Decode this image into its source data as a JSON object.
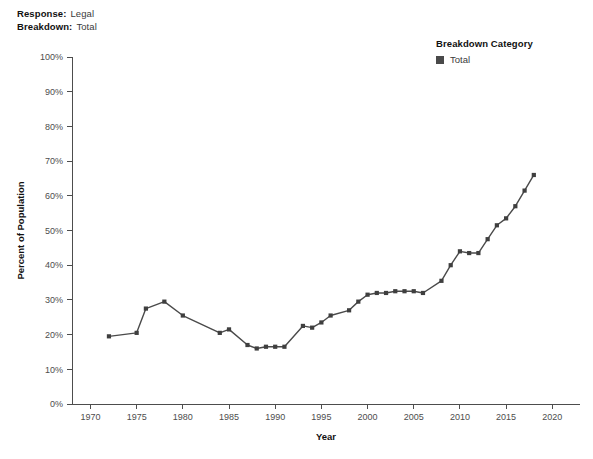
{
  "header": {
    "response_key": "Response:",
    "response_value": "Legal",
    "breakdown_key": "Breakdown:",
    "breakdown_value": "Total"
  },
  "legend": {
    "title": "Breakdown Category",
    "entries": [
      {
        "label": "Total",
        "color": "#4a4a4a"
      }
    ]
  },
  "colors": {
    "series": "#4a4a4a",
    "axis": "#4d4d4d",
    "text": "#1a1a1a",
    "background": "#ffffff"
  },
  "chart_data": {
    "type": "line",
    "title": "",
    "xlabel": "Year",
    "ylabel": "Percent of Population",
    "xlim": [
      1968,
      2023
    ],
    "ylim": [
      0,
      100
    ],
    "xticks": [
      1970,
      1975,
      1980,
      1985,
      1990,
      1995,
      2000,
      2005,
      2010,
      2015,
      2020
    ],
    "xtick_labels": [
      "1970",
      "1975",
      "1980",
      "1985",
      "1990",
      "1995",
      "2000",
      "2005",
      "2010",
      "2015",
      "2020"
    ],
    "yticks": [
      0,
      10,
      20,
      30,
      40,
      50,
      60,
      70,
      80,
      90,
      100
    ],
    "ytick_labels": [
      "0%",
      "10%",
      "20%",
      "30%",
      "40%",
      "50%",
      "60%",
      "70%",
      "80%",
      "90%",
      "100%"
    ],
    "grid": false,
    "legend_position": "top-right",
    "markers": true,
    "series": [
      {
        "name": "Total",
        "color": "#4a4a4a",
        "x": [
          1972,
          1975,
          1976,
          1978,
          1980,
          1984,
          1985,
          1987,
          1988,
          1989,
          1990,
          1991,
          1993,
          1994,
          1995,
          1996,
          1998,
          1999,
          2000,
          2001,
          2002,
          2003,
          2004,
          2005,
          2006,
          2008,
          2009,
          2010,
          2011,
          2012,
          2013,
          2014,
          2015,
          2016,
          2017,
          2018
        ],
        "values": [
          19.5,
          20.5,
          27.5,
          29.5,
          25.5,
          20.5,
          21.5,
          17.0,
          16.0,
          16.5,
          16.5,
          16.5,
          22.5,
          22.0,
          23.5,
          25.5,
          27.0,
          29.5,
          31.5,
          32.0,
          32.0,
          32.5,
          32.5,
          32.5,
          32.0,
          35.5,
          40.0,
          44.0,
          43.5,
          43.5,
          47.5,
          51.5,
          53.5,
          57.0,
          61.5,
          66.0
        ]
      }
    ]
  },
  "caption": ""
}
